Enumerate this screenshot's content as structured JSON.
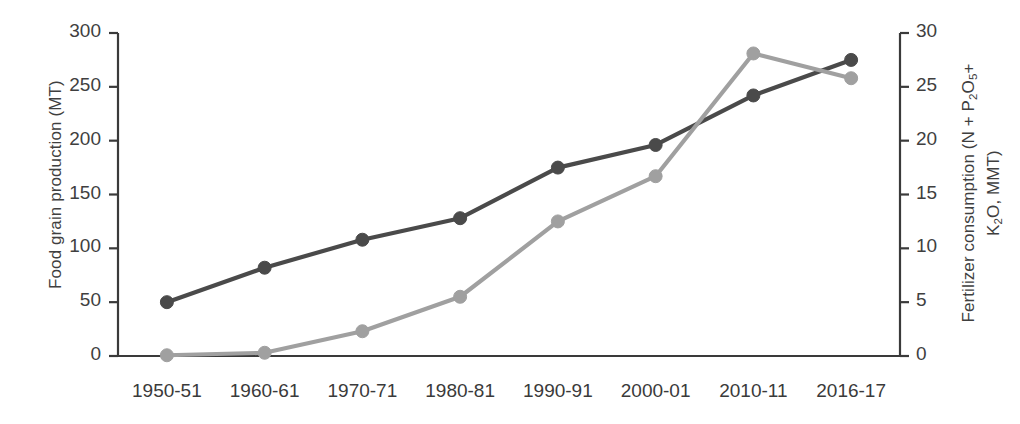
{
  "chart_data": {
    "type": "line",
    "title": "",
    "subtitle": "",
    "xlabel": "",
    "categories": [
      "1950-51",
      "1960-61",
      "1970-71",
      "1980-81",
      "1990-91",
      "2000-01",
      "2010-11",
      "2016-17"
    ],
    "grid": false,
    "legend": "none",
    "axes": {
      "left": {
        "label": "Food grain production (MT)",
        "ticks": [
          0,
          50,
          100,
          150,
          200,
          250,
          300
        ],
        "tick_labels": [
          "0",
          "50",
          "100",
          "150",
          "200",
          "250",
          "300"
        ],
        "ylim": [
          0,
          300
        ]
      },
      "right": {
        "label_line1_prefix": "Fertilizer consumption (N + P",
        "label_line1_sub1": "2",
        "label_line1_mid": "O",
        "label_line1_sub2": "5",
        "label_line1_suffix": "+",
        "label_line2_prefix": "K",
        "label_line2_sub": "2",
        "label_line2_suffix": "O, MMT)",
        "label_plain": "Fertilizer consumption (N + P2O5+ K2O, MMT)",
        "ticks": [
          0,
          5,
          10,
          15,
          20,
          25,
          30
        ],
        "tick_labels": [
          "0",
          "5",
          "10",
          "15",
          "20",
          "25",
          "30"
        ],
        "ylim": [
          0,
          30
        ]
      }
    },
    "series": [
      {
        "name": "Food grain production",
        "axis": "left",
        "color": "#4a4a4a",
        "marker": "circle",
        "values": [
          50,
          82,
          108,
          128,
          175,
          196,
          242,
          275
        ]
      },
      {
        "name": "Fertilizer consumption",
        "axis": "right",
        "color": "#a0a0a0",
        "marker": "circle",
        "values": [
          0.07,
          0.3,
          2.3,
          5.5,
          12.5,
          16.7,
          28.1,
          25.8
        ]
      }
    ]
  },
  "colors": {
    "dark_series": "#4a4a4a",
    "light_series": "#a0a0a0",
    "axis": "#3a3a3a",
    "text": "#3f3f3f",
    "background": "#ffffff"
  }
}
